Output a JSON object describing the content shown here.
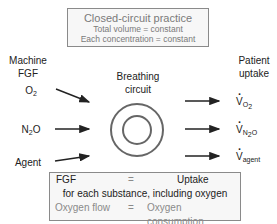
{
  "top_box": {
    "title": "Closed-circuit practice",
    "line1": "Total volume = constant",
    "line2": "Each concentration = constant"
  },
  "left": {
    "header_line1": "Machine",
    "header_line2": "FGF",
    "inputs": [
      {
        "base": "O",
        "sub": "2",
        "tail": ""
      },
      {
        "base": "N",
        "sub": "2",
        "tail": "O"
      },
      {
        "base": "Agent",
        "sub": "",
        "tail": ""
      }
    ]
  },
  "center": {
    "label_line1": "Breathing",
    "label_line2": "circuit"
  },
  "right": {
    "header_line1": "Patient",
    "header_line2": "uptake",
    "outputs": [
      {
        "base": "V",
        "sub": "O",
        "subsub": "2",
        "subtail": ""
      },
      {
        "base": "V",
        "sub": "N",
        "subsub": "2",
        "subtail": "O"
      },
      {
        "base": "V",
        "sub": "agent",
        "subsub": "",
        "subtail": ""
      }
    ]
  },
  "bottom_box": {
    "row1_left": "FGF",
    "row1_eq": "=",
    "row1_right": "Uptake",
    "row2": "for each substance, including oxygen",
    "row3_left": "Oxygen flow",
    "row3_eq": "=",
    "row3_right": "Oxygen consumption"
  },
  "colors": {
    "box_border": "#8a8a8a",
    "box_fill": "#f7f7f7",
    "gray_text": "#7a7a7a",
    "ink": "#222222"
  }
}
